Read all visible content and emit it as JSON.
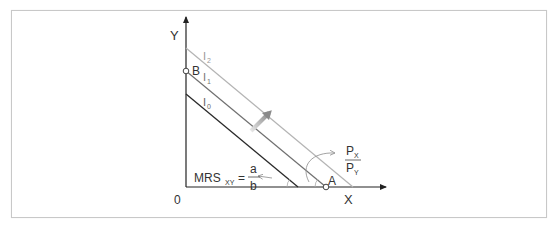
{
  "diagram": {
    "type": "indifference-curve-budget-line",
    "axes": {
      "x_label": "X",
      "y_label": "Y",
      "origin_label": "0"
    },
    "lines": [
      {
        "id": "I0",
        "label_main": "I",
        "label_sub": "0",
        "color": "#2a2a2a"
      },
      {
        "id": "I1",
        "label_main": "I",
        "label_sub": "1",
        "color": "#707070"
      },
      {
        "id": "I2",
        "label_main": "I",
        "label_sub": "2",
        "color": "#b4b4b4"
      }
    ],
    "points": [
      {
        "id": "B",
        "label": "B"
      },
      {
        "id": "A",
        "label": "A"
      }
    ],
    "annotations": {
      "mrs": {
        "main": "MRS",
        "sub": "XY",
        "eq": "=",
        "numerator": "a",
        "denominator": "b"
      },
      "price_ratio": {
        "numerator_main": "P",
        "numerator_sub": "X",
        "denominator_main": "P",
        "denominator_sub": "Y"
      }
    },
    "shift_arrow_color": "#8a8a8a"
  }
}
